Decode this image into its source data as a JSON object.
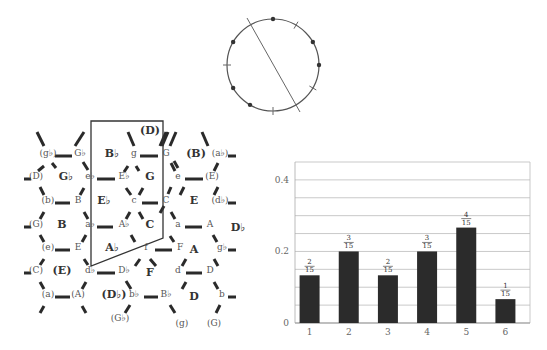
{
  "clock_diagram": {
    "center": [
      273,
      65
    ],
    "radius": 46,
    "positions": 12,
    "dot_positions": [
      0,
      2,
      3,
      7,
      8,
      10
    ],
    "tick_positions": [
      1,
      4,
      6,
      9
    ],
    "axis_line": {
      "from": [
        247,
        18
      ],
      "to": [
        300,
        112
      ]
    }
  },
  "tonnetz": {
    "nodes": [
      {
        "t": "(g♭)",
        "x": 48,
        "y": 156
      },
      {
        "t": "G♭",
        "x": 80,
        "y": 156
      },
      {
        "t": "(D)",
        "x": 36,
        "y": 179
      },
      {
        "t": "e♭",
        "x": 90,
        "y": 179
      },
      {
        "t": "(b)",
        "x": 48,
        "y": 203
      },
      {
        "t": "B",
        "x": 78,
        "y": 203
      },
      {
        "t": "(G)",
        "x": 36,
        "y": 227
      },
      {
        "t": "a♭",
        "x": 90,
        "y": 227
      },
      {
        "t": "(e)",
        "x": 48,
        "y": 250
      },
      {
        "t": "E",
        "x": 78,
        "y": 250
      },
      {
        "t": "(C)",
        "x": 36,
        "y": 273
      },
      {
        "t": "d♭",
        "x": 90,
        "y": 273
      },
      {
        "t": "(a)",
        "x": 48,
        "y": 297
      },
      {
        "t": "(A)",
        "x": 78,
        "y": 297
      },
      {
        "t": "g",
        "x": 134,
        "y": 156
      },
      {
        "t": "G",
        "x": 166,
        "y": 156
      },
      {
        "t": "E♭",
        "x": 124,
        "y": 179
      },
      {
        "t": "e",
        "x": 178,
        "y": 179
      },
      {
        "t": "c",
        "x": 134,
        "y": 203
      },
      {
        "t": "C",
        "x": 166,
        "y": 203
      },
      {
        "t": "A♭",
        "x": 124,
        "y": 227
      },
      {
        "t": "a",
        "x": 178,
        "y": 227
      },
      {
        "t": "f",
        "x": 146,
        "y": 250
      },
      {
        "t": "F",
        "x": 180,
        "y": 250
      },
      {
        "t": "D♭",
        "x": 124,
        "y": 273
      },
      {
        "t": "d",
        "x": 178,
        "y": 273
      },
      {
        "t": "b♭",
        "x": 134,
        "y": 297
      },
      {
        "t": "B♭",
        "x": 166,
        "y": 297
      },
      {
        "t": "(G♭)",
        "x": 120,
        "y": 321
      },
      {
        "t": "(g)",
        "x": 182,
        "y": 326
      },
      {
        "t": "(a♭)",
        "x": 220,
        "y": 156
      },
      {
        "t": "(E)",
        "x": 212,
        "y": 179
      },
      {
        "t": "(d♭)",
        "x": 220,
        "y": 203
      },
      {
        "t": "A",
        "x": 210,
        "y": 227
      },
      {
        "t": "g♭",
        "x": 222,
        "y": 250
      },
      {
        "t": "D",
        "x": 210,
        "y": 273
      },
      {
        "t": "b",
        "x": 222,
        "y": 297
      },
      {
        "t": "(G)",
        "x": 214,
        "y": 326
      }
    ],
    "keys": [
      {
        "t": "G♭",
        "x": 66,
        "y": 180
      },
      {
        "t": "B",
        "x": 62,
        "y": 228
      },
      {
        "t": "(E)",
        "x": 62,
        "y": 274
      },
      {
        "t": "(D♭)",
        "x": 114,
        "y": 298
      },
      {
        "t": "B♭",
        "x": 112,
        "y": 157
      },
      {
        "t": "(D)",
        "x": 150,
        "y": 134
      },
      {
        "t": "E♭",
        "x": 104,
        "y": 204
      },
      {
        "t": "A♭",
        "x": 112,
        "y": 251
      },
      {
        "t": "G",
        "x": 150,
        "y": 180
      },
      {
        "t": "C",
        "x": 150,
        "y": 228
      },
      {
        "t": "F",
        "x": 150,
        "y": 276
      },
      {
        "t": "(B)",
        "x": 196,
        "y": 157
      },
      {
        "t": "E",
        "x": 194,
        "y": 204
      },
      {
        "t": "A",
        "x": 194,
        "y": 253
      },
      {
        "t": "D",
        "x": 194,
        "y": 300
      },
      {
        "t": "D♭",
        "x": 238,
        "y": 231
      }
    ],
    "region_outline": "91,121 163,121 163,238 91,266"
  },
  "chart_data": {
    "type": "bar",
    "title": "",
    "xlabel": "",
    "ylabel": "",
    "categories": [
      "1",
      "2",
      "3",
      "4",
      "5",
      "6"
    ],
    "values": [
      0.1333,
      0.2,
      0.1333,
      0.2,
      0.2667,
      0.0667
    ],
    "value_labels": [
      {
        "num": "2",
        "den": "15"
      },
      {
        "num": "3",
        "den": "15"
      },
      {
        "num": "2",
        "den": "15"
      },
      {
        "num": "3",
        "den": "15"
      },
      {
        "num": "4",
        "den": "15"
      },
      {
        "num": "1",
        "den": "15"
      }
    ],
    "yticks": [
      "0",
      "0.2",
      "0.4"
    ],
    "ylim": [
      0,
      0.45
    ],
    "grid": true,
    "grid_step": 0.05,
    "bar_color": "#2b2b2b"
  }
}
